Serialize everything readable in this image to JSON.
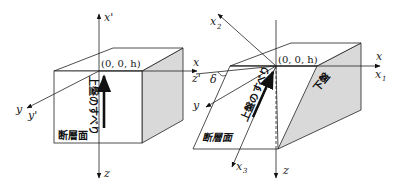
{
  "left_figure": {
    "origin_label": "(0, 0, h)",
    "axes": {
      "up": "x'",
      "down": "z",
      "right_top": "x",
      "right_bottom": "z'",
      "left_top": "y",
      "left_bottom": "y'"
    },
    "slip_label": "上盤のすべり",
    "fault_plane_label": "断層面"
  },
  "right_figure": {
    "origin_label": "(0, 0, h)",
    "axes": {
      "x2": "x",
      "x2_sub": "2",
      "left_x": "x",
      "left_z_prime": "z'",
      "dip_angle": "δ",
      "y": "y",
      "right_x": "x",
      "x1": "x",
      "x1_sub": "1",
      "x3": "x",
      "x3_sub": "3",
      "down": "z"
    },
    "slip_label": "上盤のすべり",
    "fault_plane_label": "断層面",
    "footwall_label": "下盤"
  },
  "colors": {
    "line": "#222222",
    "shade": "#d9d9d9",
    "background": "#ffffff"
  }
}
